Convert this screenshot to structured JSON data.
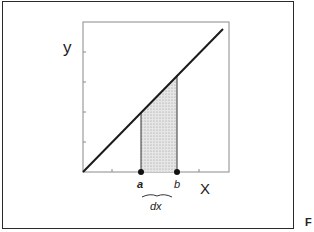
{
  "figure": {
    "y_axis_label": "y",
    "x_axis_label": "X",
    "point_a_label": "a",
    "point_b_label": "b",
    "interval_label": "dx",
    "figure_tag": "F"
  },
  "colors": {
    "line": "#1a1a1a",
    "axis_box": "#8a8a8a",
    "shade": "#d9d9d9",
    "frame": "#2a2a2a"
  }
}
